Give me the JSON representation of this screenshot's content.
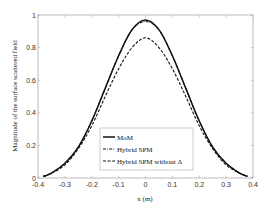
{
  "chart_data": {
    "type": "line",
    "title": "",
    "xlabel": "x (m)",
    "ylabel": "Magnitude of the surface scattered field",
    "xlim": [
      -0.4,
      0.4
    ],
    "ylim": [
      0,
      1
    ],
    "xticks": [
      -0.4,
      -0.3,
      -0.2,
      -0.1,
      0,
      0.1,
      0.2,
      0.3,
      0.4
    ],
    "xtick_labels": [
      "-0.4",
      "-0.3",
      "-0.2",
      "-0.1",
      "0",
      "0.1",
      "0.2",
      "0.3",
      "0.4"
    ],
    "yticks": [
      0,
      0.2,
      0.4,
      0.6,
      0.8,
      1
    ],
    "ytick_labels": [
      "0",
      "0.2",
      "0.4",
      "0.6",
      "0.8",
      "1"
    ],
    "grid": false,
    "legend_position": "lower center (inside axes)",
    "x": [
      -0.38,
      -0.35,
      -0.3,
      -0.25,
      -0.2,
      -0.15,
      -0.1,
      -0.05,
      0,
      0.05,
      0.1,
      0.15,
      0.2,
      0.25,
      0.3,
      0.35,
      0.38
    ],
    "series": [
      {
        "name": "MoM",
        "style": "solid",
        "values": [
          0.01,
          0.03,
          0.09,
          0.19,
          0.35,
          0.55,
          0.75,
          0.91,
          0.97,
          0.91,
          0.75,
          0.55,
          0.35,
          0.19,
          0.09,
          0.03,
          0.01
        ]
      },
      {
        "name": "Hybrid SPM",
        "style": "dash-dot",
        "values": [
          0.01,
          0.03,
          0.09,
          0.19,
          0.35,
          0.55,
          0.75,
          0.91,
          0.96,
          0.91,
          0.75,
          0.55,
          0.35,
          0.19,
          0.09,
          0.03,
          0.01
        ]
      },
      {
        "name": "Hybrid SPM without Δ",
        "style": "dashed",
        "values": [
          0.01,
          0.03,
          0.08,
          0.18,
          0.32,
          0.5,
          0.67,
          0.8,
          0.86,
          0.8,
          0.67,
          0.5,
          0.32,
          0.18,
          0.08,
          0.03,
          0.01
        ]
      }
    ]
  },
  "legend": {
    "items": [
      {
        "label": "MoM",
        "style": "solid"
      },
      {
        "label": "Hybrid SPM",
        "style": "dash-dot"
      },
      {
        "label": "Hybrid SPM without Δ",
        "style": "dashed"
      }
    ]
  },
  "colors": {
    "line": "#111111",
    "axis": "#aaaaaa",
    "background": "#ffffff"
  }
}
